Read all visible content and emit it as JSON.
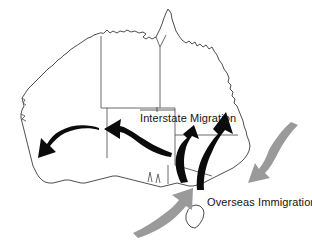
{
  "figure": {
    "background_color": "#ffffff",
    "outline_color": "#3a3a3a",
    "border_color": "#5a5a5a"
  },
  "labels": {
    "interstate": {
      "text": "Interstate Migration",
      "x": 140,
      "y": 122,
      "color": "#141414"
    },
    "overseas": {
      "text": "Overseas Immigration",
      "x": 207,
      "y": 206,
      "color": "#141414"
    }
  },
  "legend_flows": [
    {
      "name": "interstate-migration",
      "label": "Interstate Migration",
      "color": "#0b0b0b",
      "arrow_count": 4,
      "description": "Black arrows: movement from south-east states westward and northward along the east coast"
    },
    {
      "name": "overseas-immigration",
      "label": "Overseas Immigration",
      "color": "#9a9a9a",
      "arrow_count": 2,
      "description": "Grey arrows: inflow from overseas toward the south-east coast"
    }
  ],
  "arrows": {
    "interstate": [
      {
        "name": "arrow-west-to-wa",
        "direction": "south-west",
        "color": "#0b0b0b"
      },
      {
        "name": "arrow-sa-to-wa",
        "direction": "west",
        "color": "#0b0b0b"
      },
      {
        "name": "arrow-vic-to-nsw",
        "direction": "north",
        "color": "#0b0b0b"
      },
      {
        "name": "arrow-nsw-to-qld",
        "direction": "north",
        "color": "#0b0b0b"
      }
    ],
    "overseas": [
      {
        "name": "arrow-overseas-east",
        "direction": "west",
        "color": "#9a9a9a"
      },
      {
        "name": "arrow-overseas-south",
        "direction": "north-east",
        "color": "#9a9a9a"
      }
    ]
  }
}
